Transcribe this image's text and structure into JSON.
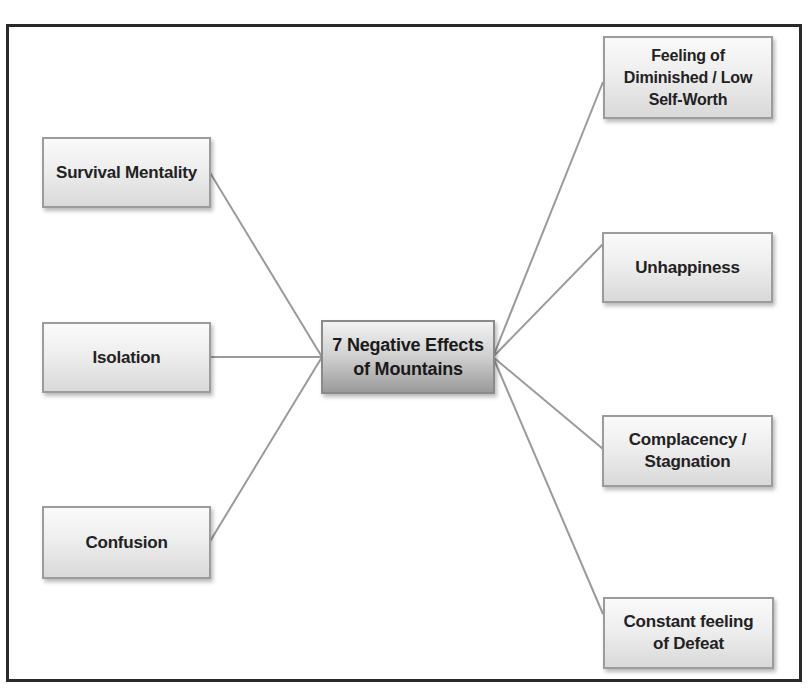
{
  "diagram": {
    "type": "mind-map",
    "center": {
      "label": "7 Negative Effects\nof Mountains"
    },
    "left_nodes": [
      {
        "label": "Survival Mentality"
      },
      {
        "label": "Isolation"
      },
      {
        "label": "Confusion"
      }
    ],
    "right_nodes": [
      {
        "label": "Feeling of\nDiminished /  Low\nSelf-Worth"
      },
      {
        "label": "Unhappiness"
      },
      {
        "label": "Complacency /\nStagnation"
      },
      {
        "label": "Constant feeling\nof Defeat"
      }
    ],
    "colors": {
      "frame_border": "#2a2a2a",
      "connector": "#9a9a9a",
      "node_border": "#9c9c9c",
      "node_fill_top": "#fafafa",
      "node_fill_bottom": "#d9d9d9",
      "center_fill_top": "#f2f2f2",
      "center_fill_bottom": "#9a9a9a",
      "text": "#222222"
    }
  }
}
